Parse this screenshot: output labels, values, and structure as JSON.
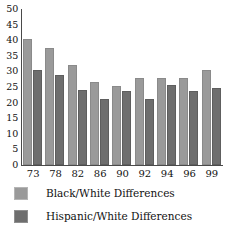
{
  "chart_data": {
    "type": "bar",
    "title": "",
    "subtitle": "",
    "xlabel": "",
    "ylabel": "",
    "ylim": [
      0,
      50
    ],
    "ytick_step": 5,
    "yticks": [
      50,
      45,
      40,
      35,
      30,
      25,
      20,
      15,
      10,
      5,
      0
    ],
    "grid": false,
    "legend_position": "bottom-left",
    "categories": [
      "73",
      "78",
      "82",
      "86",
      "90",
      "92",
      "94",
      "96",
      "99"
    ],
    "series": [
      {
        "name": "Black/White Differences",
        "color": "#9a9a9a",
        "values": [
          40.5,
          37.5,
          32.0,
          26.5,
          25.3,
          28.0,
          27.8,
          28.0,
          30.5
        ]
      },
      {
        "name": "Hispanic/White Differences",
        "color": "#6e6e6e",
        "values": [
          30.4,
          29.0,
          24.0,
          21.2,
          23.7,
          21.2,
          25.5,
          23.6,
          24.7
        ]
      }
    ]
  },
  "legend": {
    "items": [
      {
        "label": "Black/White Differences",
        "swatch": "light"
      },
      {
        "label": "Hispanic/White Differences",
        "swatch": "dark"
      }
    ]
  }
}
